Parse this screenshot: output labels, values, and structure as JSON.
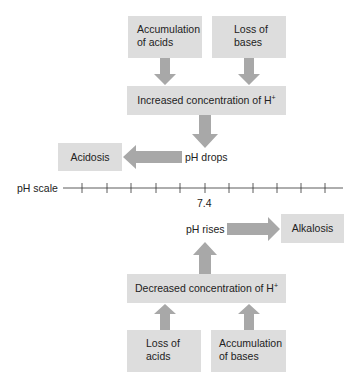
{
  "colors": {
    "box": "#dddddd",
    "arrow": "#a8a8a8",
    "line": "#333333"
  },
  "top": {
    "cause_left": {
      "line1": "Accumulation",
      "line2": "of acids"
    },
    "cause_right": {
      "line1": "Loss of",
      "line2": "bases"
    },
    "result": {
      "text": "Increased concentration of H",
      "sup": "+"
    },
    "change_label": "pH drops",
    "outcome": "Acidosis"
  },
  "scale": {
    "label": "pH scale",
    "center_value": "7.4",
    "tick_count": 11
  },
  "bottom": {
    "change_label": "pH rises",
    "outcome": "Alkalosis",
    "result": {
      "text": "Decreased concentration of H",
      "sup": "+"
    },
    "cause_left": {
      "line1": "Loss of",
      "line2": "acids"
    },
    "cause_right": {
      "line1": "Accumulation",
      "line2": "of bases"
    }
  }
}
